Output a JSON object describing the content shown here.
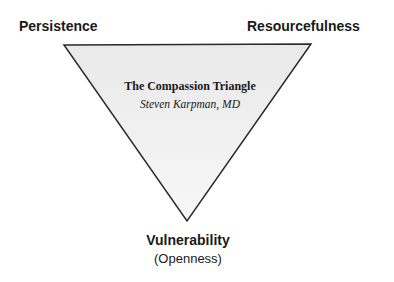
{
  "diagram": {
    "title": "The Compassion Triangle",
    "author": "Steven Karpman, MD",
    "vertices": {
      "top_left": "Persistence",
      "top_right": "Resourcefulness",
      "bottom": "Vulnerability",
      "bottom_subtitle": "(Openness)"
    },
    "colors": {
      "fill_top": "#e9e9e9",
      "fill_bottom": "#f7f7f7",
      "stroke": "#2a2a2a",
      "text": "#1a1a1a"
    }
  }
}
